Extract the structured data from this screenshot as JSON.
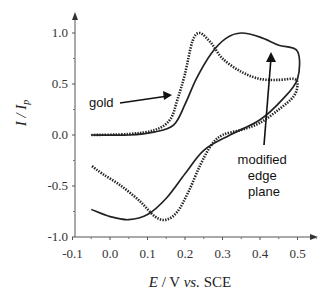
{
  "chart_data": {
    "type": "line",
    "title": "",
    "xlabel": "E / V vs. SCE",
    "ylabel": "I / I_p",
    "xlim": [
      -0.1,
      0.5
    ],
    "ylim": [
      -1.0,
      1.0
    ],
    "xticks": [
      "-0.1",
      "0.0",
      "0.1",
      "0.2",
      "0.3",
      "0.4",
      "0.5"
    ],
    "yticks": [
      "1.0",
      "0.5",
      "0.0",
      "-0.5",
      "-1.0"
    ],
    "grid": false,
    "legend": "none (inline annotations)",
    "annotations": [
      "gold",
      "modified edge plane"
    ],
    "series": [
      {
        "name": "gold",
        "style": "dotted",
        "color": "#222222",
        "points": [
          [
            -0.05,
            0.0
          ],
          [
            0.05,
            0.01
          ],
          [
            0.12,
            0.05
          ],
          [
            0.16,
            0.15
          ],
          [
            0.18,
            0.35
          ],
          [
            0.2,
            0.6
          ],
          [
            0.22,
            0.92
          ],
          [
            0.24,
            1.0
          ],
          [
            0.27,
            0.9
          ],
          [
            0.3,
            0.75
          ],
          [
            0.35,
            0.62
          ],
          [
            0.4,
            0.55
          ],
          [
            0.45,
            0.54
          ],
          [
            0.49,
            0.55
          ],
          [
            0.5,
            0.5
          ],
          [
            0.49,
            0.38
          ],
          [
            0.45,
            0.25
          ],
          [
            0.4,
            0.12
          ],
          [
            0.35,
            0.05
          ],
          [
            0.3,
            0.0
          ],
          [
            0.27,
            -0.1
          ],
          [
            0.24,
            -0.3
          ],
          [
            0.21,
            -0.55
          ],
          [
            0.18,
            -0.75
          ],
          [
            0.15,
            -0.83
          ],
          [
            0.12,
            -0.8
          ],
          [
            0.08,
            -0.65
          ],
          [
            0.03,
            -0.5
          ],
          [
            -0.02,
            -0.38
          ],
          [
            -0.05,
            -0.3
          ]
        ]
      },
      {
        "name": "modified edge plane",
        "style": "solid",
        "color": "#222222",
        "points": [
          [
            -0.05,
            0.0
          ],
          [
            0.05,
            0.0
          ],
          [
            0.12,
            0.03
          ],
          [
            0.17,
            0.1
          ],
          [
            0.2,
            0.3
          ],
          [
            0.23,
            0.55
          ],
          [
            0.27,
            0.8
          ],
          [
            0.31,
            0.95
          ],
          [
            0.35,
            1.0
          ],
          [
            0.4,
            0.96
          ],
          [
            0.45,
            0.88
          ],
          [
            0.5,
            0.82
          ],
          [
            0.5,
            0.55
          ],
          [
            0.46,
            0.35
          ],
          [
            0.4,
            0.15
          ],
          [
            0.32,
            0.0
          ],
          [
            0.25,
            -0.15
          ],
          [
            0.2,
            -0.38
          ],
          [
            0.15,
            -0.62
          ],
          [
            0.1,
            -0.78
          ],
          [
            0.05,
            -0.83
          ],
          [
            0.0,
            -0.8
          ],
          [
            -0.05,
            -0.73
          ]
        ]
      }
    ]
  },
  "axes": {
    "xlabel_italic": "E",
    "xlabel_rest": " / V ",
    "xlabel_vs": "vs.",
    "xlabel_ref": " SCE",
    "ylabel_main": "I / I",
    "ylabel_sub": "p"
  },
  "labels": {
    "gold": "gold",
    "modified_line1": "modified",
    "modified_line2": "edge",
    "modified_line3": "plane"
  }
}
